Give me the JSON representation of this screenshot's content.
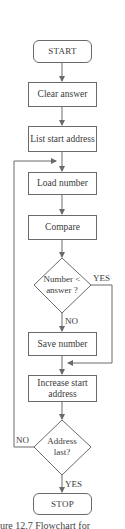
{
  "diagram": {
    "type": "flowchart",
    "nodes": {
      "start": "START",
      "clear_answer": "Clear answer",
      "list_start_address": "List start address",
      "load_number": "Load number",
      "compare": "Compare",
      "decision_number": "Number < answer ?",
      "save_number": "Save number",
      "increase_start_address": "Increase start address",
      "decision_address": "Address last?",
      "stop": "STOP"
    },
    "labels": {
      "yes_number": "YES",
      "no_number": "NO",
      "no_address": "NO",
      "yes_address": "YES"
    },
    "caption": "ure 12.7   Flowchart for"
  }
}
